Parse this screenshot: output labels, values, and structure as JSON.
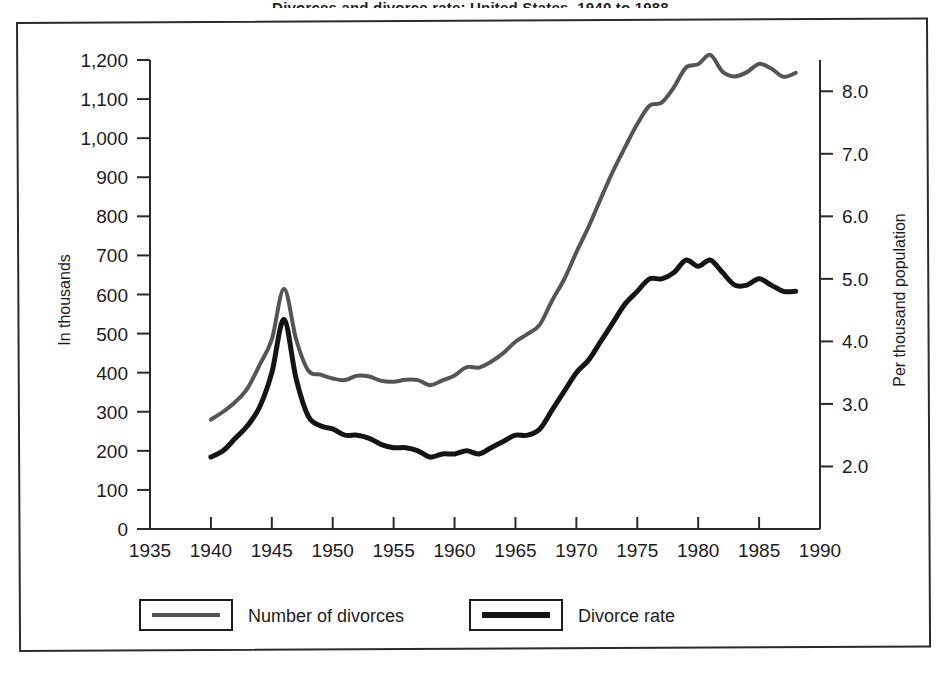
{
  "page": {
    "title_partial": "Divorces and divorce rate: United States, 1940 to 1988",
    "background_color": "#ffffff",
    "frame_color": "#2b2b2b"
  },
  "chart_data": {
    "type": "line",
    "title": "",
    "xlabel": "",
    "ylabel": "In thousands",
    "y2label": "Per thousand population",
    "xlim": [
      1935,
      1990
    ],
    "ylim": [
      0,
      1200
    ],
    "y2lim": [
      1.0,
      8.5
    ],
    "grid": false,
    "legend_position": "bottom-left",
    "xticks": [
      1935,
      1940,
      1945,
      1950,
      1955,
      1960,
      1965,
      1970,
      1975,
      1980,
      1985,
      1990
    ],
    "xtick_labels": [
      "1935",
      "1940",
      "1945",
      "1950",
      "1955",
      "1960",
      "1965",
      "1970",
      "1975",
      "1980",
      "1985",
      "1990"
    ],
    "yticks": [
      0,
      100,
      200,
      300,
      400,
      500,
      600,
      700,
      800,
      900,
      1000,
      1100,
      1200
    ],
    "ytick_labels": [
      "0",
      "100",
      "200",
      "300",
      "400",
      "500",
      "600",
      "700",
      "800",
      "900",
      "1,000",
      "1,100",
      "1,200"
    ],
    "y2ticks": [
      2.0,
      3.0,
      4.0,
      5.0,
      6.0,
      7.0,
      8.0
    ],
    "y2tick_labels": [
      "2.0",
      "3.0",
      "4.0",
      "5.0",
      "6.0",
      "7.0",
      "8.0"
    ],
    "x": [
      1940,
      1941,
      1942,
      1943,
      1944,
      1945,
      1946,
      1947,
      1948,
      1949,
      1950,
      1951,
      1952,
      1953,
      1954,
      1955,
      1956,
      1957,
      1958,
      1959,
      1960,
      1961,
      1962,
      1963,
      1964,
      1965,
      1966,
      1967,
      1968,
      1969,
      1970,
      1971,
      1972,
      1973,
      1974,
      1975,
      1976,
      1977,
      1978,
      1979,
      1980,
      1981,
      1982,
      1983,
      1984,
      1985,
      1986,
      1987,
      1988
    ],
    "series": [
      {
        "name": "Number of divorces",
        "axis": "left",
        "color": "#555555",
        "unit": "thousands",
        "values": [
          280,
          300,
          325,
          360,
          420,
          485,
          615,
          485,
          405,
          395,
          385,
          381,
          392,
          390,
          379,
          377,
          382,
          381,
          368,
          380,
          393,
          414,
          413,
          428,
          450,
          479,
          499,
          523,
          584,
          639,
          708,
          773,
          845,
          915,
          977,
          1036,
          1083,
          1091,
          1130,
          1181,
          1189,
          1213,
          1170,
          1158,
          1169,
          1190,
          1178,
          1157,
          1167
        ]
      },
      {
        "name": "Divorce rate",
        "axis": "right",
        "color": "#141414",
        "unit": "per 1,000 population",
        "values": [
          2.15,
          2.25,
          2.45,
          2.65,
          2.95,
          3.5,
          4.35,
          3.4,
          2.8,
          2.65,
          2.6,
          2.5,
          2.5,
          2.45,
          2.35,
          2.3,
          2.3,
          2.25,
          2.15,
          2.2,
          2.2,
          2.25,
          2.2,
          2.3,
          2.4,
          2.5,
          2.5,
          2.6,
          2.9,
          3.2,
          3.5,
          3.7,
          4.0,
          4.3,
          4.6,
          4.8,
          5.0,
          5.0,
          5.1,
          5.3,
          5.2,
          5.3,
          5.1,
          4.9,
          4.9,
          5.0,
          4.9,
          4.8,
          4.8
        ]
      }
    ]
  },
  "legend": {
    "items": [
      {
        "label": "Number of divorces",
        "color": "#555555"
      },
      {
        "label": "Divorce rate",
        "color": "#141414"
      }
    ]
  }
}
